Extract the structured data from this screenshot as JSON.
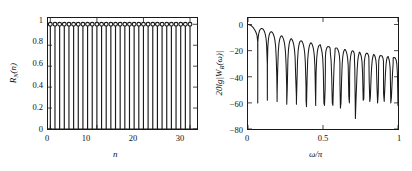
{
  "figure": {
    "background_color": "#ffffff",
    "line_color": "#1a1a1a",
    "panels": [
      {
        "id": "time-domain",
        "name": "rectangular-window-time-domain"
      },
      {
        "id": "frequency-domain",
        "name": "rectangular-window-frequency-response"
      }
    ]
  },
  "left_plot": {
    "ylabel_main": "R",
    "ylabel_sub": "N",
    "ylabel_arg": "(n)",
    "xlabel": "n",
    "yticks": [
      "0",
      "0.2",
      "0.4",
      "0.6",
      "0.8",
      "1"
    ],
    "xticks": [
      "0",
      "10",
      "20",
      "30"
    ]
  },
  "right_plot": {
    "ylabel_prefix": "20lg|W",
    "ylabel_sub": "R",
    "ylabel_suffix": "(ω)|",
    "xlabel": "ω/π",
    "yticks": [
      "0",
      "−20",
      "−40",
      "−60",
      "−80"
    ],
    "xticks": [
      "0",
      "0.5",
      "1"
    ]
  },
  "chart_data": [
    {
      "type": "bar",
      "title": "",
      "subtitle": "",
      "plot_style": "stem",
      "marker": "open-circle",
      "xlabel": "n",
      "ylabel": "R_N(n)",
      "xlim": [
        -0.5,
        31.5
      ],
      "ylim": [
        0,
        1.06
      ],
      "xticks": [
        0,
        10,
        20,
        30
      ],
      "yticks": [
        0,
        0.2,
        0.4,
        0.6,
        0.8,
        1
      ],
      "grid": false,
      "legend": null,
      "categories": [
        0,
        1,
        2,
        3,
        4,
        5,
        6,
        7,
        8,
        9,
        10,
        11,
        12,
        13,
        14,
        15,
        16,
        17,
        18,
        19,
        20,
        21,
        22,
        23,
        24,
        25,
        26,
        27,
        28,
        29,
        30
      ],
      "values": [
        1,
        1,
        1,
        1,
        1,
        1,
        1,
        1,
        1,
        1,
        1,
        1,
        1,
        1,
        1,
        1,
        1,
        1,
        1,
        1,
        1,
        1,
        1,
        1,
        1,
        1,
        1,
        1,
        1,
        1,
        1
      ]
    },
    {
      "type": "line",
      "title": "",
      "subtitle": "",
      "xlabel": "ω/π",
      "ylabel": "20lg|W_R(ω)| (dB)",
      "xlim": [
        0,
        1
      ],
      "ylim": [
        -80,
        5
      ],
      "xticks": [
        0,
        0.5,
        1
      ],
      "yticks": [
        0,
        -20,
        -40,
        -60,
        -80
      ],
      "grid": false,
      "legend": null,
      "window_length_N": 31,
      "series": [
        {
          "name": "20lg|W_R(ω)|",
          "x": [
            0,
            0.004,
            0.008,
            0.012,
            0.016,
            0.02,
            0.024,
            0.028,
            0.032,
            0.036,
            0.04,
            0.044,
            0.048,
            0.052,
            0.056,
            0.06,
            0.0645,
            0.065,
            0.0655,
            0.068,
            0.072,
            0.076,
            0.08,
            0.084,
            0.088,
            0.092,
            0.096,
            0.0967,
            0.1,
            0.104,
            0.108,
            0.112,
            0.116,
            0.12,
            0.124,
            0.1285,
            0.129,
            0.1295,
            0.132,
            0.136,
            0.14,
            0.144,
            0.148,
            0.152,
            0.156,
            0.16,
            0.1612,
            0.164,
            0.168,
            0.172,
            0.176,
            0.18,
            0.184,
            0.188,
            0.192,
            0.1935,
            0.194,
            0.1945,
            0.198,
            0.202,
            0.206,
            0.21,
            0.214,
            0.218,
            0.222,
            0.2258,
            0.226,
            0.2262,
            0.23,
            0.234,
            0.238,
            0.242,
            0.246,
            0.25,
            0.254,
            0.258,
            0.2581,
            0.2583,
            0.262,
            0.266,
            0.27,
            0.274,
            0.278,
            0.282,
            0.286,
            0.29,
            0.2903,
            0.2905,
            0.294,
            0.298,
            0.302,
            0.306,
            0.31,
            0.314,
            0.318,
            0.3225,
            0.3227,
            0.326,
            0.33,
            0.334,
            0.338,
            0.342,
            0.346,
            0.35,
            0.3547,
            0.3549,
            0.358,
            0.362,
            0.366,
            0.37,
            0.374,
            0.378,
            0.382,
            0.3868,
            0.387,
            0.39,
            0.394,
            0.398,
            0.402,
            0.406,
            0.41,
            0.414,
            0.418,
            0.419,
            0.4193,
            0.422,
            0.426,
            0.43,
            0.434,
            0.438,
            0.442,
            0.446,
            0.45,
            0.4513,
            0.4516,
            0.454,
            0.458,
            0.462,
            0.466,
            0.47,
            0.474,
            0.478,
            0.482,
            0.4835,
            0.4838,
            0.486,
            0.49,
            0.494,
            0.498,
            0.502,
            0.506,
            0.51,
            0.514,
            0.5158,
            0.516,
            0.518,
            0.522,
            0.526,
            0.53,
            0.534,
            0.538,
            0.542,
            0.546,
            0.548,
            0.5483,
            0.55,
            0.554,
            0.558,
            0.562,
            0.566,
            0.57,
            0.574,
            0.578,
            0.58,
            0.5805,
            0.582,
            0.586,
            0.59,
            0.594,
            0.598,
            0.602,
            0.606,
            0.61,
            0.6128,
            0.613,
            0.616,
            0.62,
            0.624,
            0.628,
            0.632,
            0.636,
            0.64,
            0.644,
            0.645,
            0.6452,
            0.648,
            0.652,
            0.656,
            0.66,
            0.664,
            0.668,
            0.672,
            0.676,
            0.6773,
            0.6775,
            0.68,
            0.684,
            0.688,
            0.692,
            0.696,
            0.7,
            0.704,
            0.708,
            0.7095,
            0.7097,
            0.712,
            0.716,
            0.72,
            0.724,
            0.728,
            0.732,
            0.736,
            0.74,
            0.7418,
            0.742,
            0.744,
            0.748,
            0.752,
            0.756,
            0.76,
            0.764,
            0.768,
            0.772,
            0.774,
            0.7742,
            0.776,
            0.78,
            0.784,
            0.788,
            0.792,
            0.796,
            0.8,
            0.804,
            0.806,
            0.8065,
            0.808,
            0.812,
            0.816,
            0.82,
            0.824,
            0.828,
            0.832,
            0.836,
            0.8385,
            0.8387,
            0.84,
            0.844,
            0.848,
            0.852,
            0.856,
            0.86,
            0.864,
            0.868,
            0.87,
            0.8708,
            0.872,
            0.876,
            0.88,
            0.884,
            0.888,
            0.892,
            0.896,
            0.9,
            0.903,
            0.9032,
            0.904,
            0.908,
            0.912,
            0.916,
            0.92,
            0.924,
            0.928,
            0.932,
            0.935,
            0.9353,
            0.936,
            0.94,
            0.944,
            0.948,
            0.952,
            0.956,
            0.96,
            0.964,
            0.9675,
            0.9677,
            0.968,
            0.972,
            0.976,
            0.98,
            0.984,
            0.988,
            0.992,
            0.996,
            1
          ],
          "y": [
            0,
            -0.03,
            -0.12,
            -0.27,
            -0.48,
            -0.75,
            -1.09,
            -1.5,
            -1.98,
            -2.54,
            -3.19,
            -3.93,
            -4.78,
            -5.76,
            -6.9,
            -8.25,
            -13.2,
            -60,
            -13.2,
            -9.9,
            -6.7,
            -5.0,
            -4.0,
            -3.4,
            -3.1,
            -3.05,
            -3.2,
            -3.25,
            -3.5,
            -4.1,
            -5.0,
            -6.2,
            -7.9,
            -10.5,
            -15.5,
            -30,
            -58,
            -30,
            -17.5,
            -11.5,
            -8.6,
            -7.0,
            -6.1,
            -5.6,
            -5.5,
            -5.8,
            -5.9,
            -6.3,
            -7.2,
            -8.4,
            -10.1,
            -12.5,
            -16.5,
            -25,
            -40,
            -52,
            -59,
            -52,
            -34,
            -20.5,
            -15.0,
            -12.0,
            -10.2,
            -9.2,
            -8.7,
            -8.6,
            -8.7,
            -8.8,
            -9.4,
            -10.4,
            -11.8,
            -13.7,
            -16.6,
            -21.3,
            -31,
            -48,
            -56,
            -61,
            -48,
            -27,
            -19.0,
            -15.2,
            -13.0,
            -11.7,
            -11.0,
            -10.8,
            -10.85,
            -10.9,
            -11.6,
            -12.6,
            -14.1,
            -16.2,
            -19.4,
            -25,
            -40,
            -55,
            -61,
            -46,
            -28,
            -20.5,
            -16.7,
            -14.5,
            -13.2,
            -12.6,
            -12.5,
            -12.55,
            -12.6,
            -13.3,
            -14.4,
            -15.9,
            -18.2,
            -21.8,
            -28.5,
            -47,
            -58,
            -63,
            -41,
            -27,
            -21.5,
            -18.1,
            -16.0,
            -14.8,
            -14.1,
            -14.0,
            -14.05,
            -14.1,
            -14.8,
            -15.9,
            -17.5,
            -19.9,
            -23.8,
            -32,
            -55,
            -62,
            -56,
            -37,
            -26,
            -21.2,
            -18.5,
            -16.9,
            -16.0,
            -15.6,
            -15.55,
            -15.6,
            -16.3,
            -17.4,
            -19.0,
            -21.5,
            -25.7,
            -35,
            -60,
            -62,
            -50,
            -34.5,
            -25.5,
            -21.5,
            -19.1,
            -17.7,
            -17.0,
            -16.9,
            -16.95,
            -17.0,
            -17.7,
            -18.8,
            -20.5,
            -23.0,
            -27.5,
            -40,
            -60,
            -62,
            -45,
            -31,
            -24.5,
            -21.0,
            -19.0,
            -18.1,
            -18.0,
            -18.05,
            -18.1,
            -18.9,
            -20.0,
            -21.7,
            -24.4,
            -29.5,
            -45,
            -64,
            -60,
            -42,
            -30,
            -24.5,
            -21.6,
            -20.0,
            -19.2,
            -19.1,
            -19.15,
            -19.2,
            -20.0,
            -21.1,
            -22.9,
            -25.7,
            -31.5,
            -55,
            -60,
            -53,
            -38,
            -29,
            -24.5,
            -22.1,
            -20.6,
            -20.15,
            -20.2,
            -20.9,
            -22.0,
            -23.9,
            -27.0,
            -34,
            -72,
            -58,
            -46,
            -34,
            -27.5,
            -24.2,
            -22.3,
            -21.3,
            -21.15,
            -21.2,
            -21.9,
            -23.1,
            -25.0,
            -28.5,
            -38,
            -58,
            -57,
            -45,
            -34,
            -28,
            -24.7,
            -22.9,
            -22.1,
            -22.05,
            -22.1,
            -22.8,
            -24.0,
            -26.0,
            -29.8,
            -43,
            -59,
            -55,
            -42,
            -33,
            -27.5,
            -24.9,
            -23.2,
            -22.9,
            -22.95,
            -23.0,
            -23.7,
            -24.9,
            -27.0,
            -31.2,
            -48,
            -60,
            -53,
            -40,
            -32,
            -27.5,
            -25.1,
            -23.9,
            -23.8,
            -23.85,
            -23.9,
            -24.6,
            -25.8,
            -28.0,
            -32.8,
            -53,
            -59,
            -49,
            -38,
            -31,
            -27.2,
            -25.1,
            -24.6,
            -24.55,
            -24.6,
            -25.3,
            -26.5,
            -28.9,
            -34.5,
            -60,
            -56,
            -46,
            -36,
            -30,
            -26.9,
            -25.4,
            -25.3,
            -25.35,
            -25.4,
            -26.1,
            -27.4,
            -30.0,
            -37,
            -62,
            -54,
            -43,
            -35,
            -29.5,
            -26.8,
            -26.1,
            -26.05,
            -26.1,
            -26.8,
            -28.2,
            -31.2,
            -40,
            -76,
            -50,
            -40,
            -33,
            -29,
            -27,
            -26.8,
            -26.9,
            -27.6,
            -29.1,
            -32.7,
            -46,
            -58,
            -46,
            -37,
            -31.5,
            -28.5,
            -27.6,
            -27.5,
            -27.6,
            -28.4,
            -30.2,
            -35,
            -60,
            -50,
            -40,
            -34,
            -30.5,
            -29,
            -28.3,
            -28.4,
            -29.3,
            -31.5,
            -40,
            -54,
            -43,
            -36,
            -32,
            -30,
            -29.4,
            -29.5,
            -30.4,
            -33.5,
            -50,
            -47,
            -38,
            -33.5,
            -31,
            -30,
            -29.9,
            -30.9,
            -34.5,
            -80,
            -40,
            -34.5,
            -31.5,
            -30.4,
            -30.3,
            -31.5,
            -38,
            -52,
            -36,
            -32,
            -30.8,
            -30.7,
            -32.5,
            -48,
            -41,
            -33,
            -31.1,
            -31.0,
            -33,
            -43,
            -34,
            -31.2,
            -31.0,
            -30.9
          ]
        }
      ]
    }
  ]
}
